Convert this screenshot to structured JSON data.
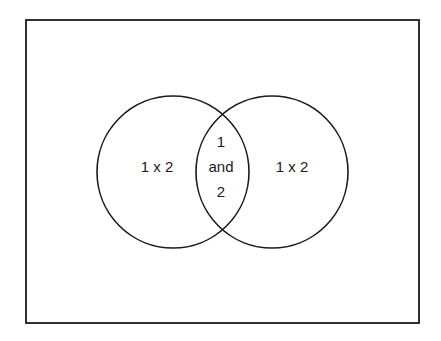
{
  "diagram": {
    "type": "venn",
    "colors": {
      "stroke": "#1a1a1a",
      "background": "#ffffff",
      "text": "#1a1a1a"
    },
    "regions": {
      "left_only": {
        "label": "1 x 2"
      },
      "intersection": {
        "lines": [
          "1",
          "and",
          "2"
        ]
      },
      "right_only": {
        "label": "1 x 2"
      }
    }
  }
}
